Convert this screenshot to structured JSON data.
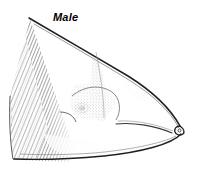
{
  "figure": {
    "kind": "scientific-line-illustration",
    "width": 203,
    "height": 173,
    "background_color": "#ffffff",
    "ink_color": "#1a1a1a",
    "stipple_color": "#555555"
  },
  "label": {
    "text": "Male",
    "style": "bold-italic",
    "color": "#000000",
    "x": 53,
    "y": 11
  },
  "anatomy": {
    "eye": {
      "name": "eye",
      "cx": 82,
      "cy": 108,
      "color": "#000000"
    },
    "snout_tip": {
      "name": "snout-tip",
      "cx": 180,
      "cy": 131
    },
    "wing_hatching": {
      "name": "left-wing-hatching",
      "x": 10,
      "y": 20,
      "width": 62,
      "height": 142,
      "tone": "#555555"
    }
  }
}
